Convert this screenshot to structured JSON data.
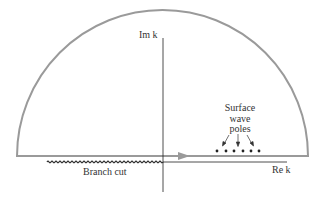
{
  "diagram": {
    "type": "complex-plane-contour",
    "labels": {
      "im_axis": "Im k",
      "re_axis": "Re k",
      "branch_cut": "Branch cut",
      "poles_line1": "Surface",
      "poles_line2": "wave",
      "poles_line3": "poles"
    },
    "poles_count": 6,
    "colors": {
      "contour": "#9a9a9a",
      "axis": "#222222",
      "branch_cut": "#333333",
      "poles": "#222222"
    }
  }
}
